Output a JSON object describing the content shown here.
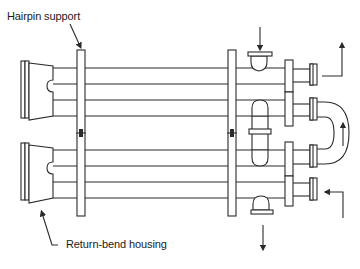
{
  "diagram": {
    "labels": {
      "hairpin_support": "Hairpin support",
      "return_bend_housing": "Return-bend housing"
    },
    "colors": {
      "line": "#2a2a2a",
      "background": "#ffffff"
    },
    "components": [
      "return-bend-housing-upper",
      "return-bend-housing-lower",
      "hairpin-support-left",
      "hairpin-support-right",
      "shell-inlet-nozzle-top",
      "shell-outlet-nozzle-bottom",
      "tube-outlet-upper-right",
      "tube-inlet-lower-right",
      "u-bend-connector"
    ],
    "flows": [
      {
        "id": "shell-inlet",
        "direction": "down"
      },
      {
        "id": "shell-outlet",
        "direction": "down"
      },
      {
        "id": "tube-outlet",
        "direction": "up"
      },
      {
        "id": "tube-inlet",
        "direction": "left"
      },
      {
        "id": "u-bend-flow",
        "direction": "up"
      }
    ]
  }
}
